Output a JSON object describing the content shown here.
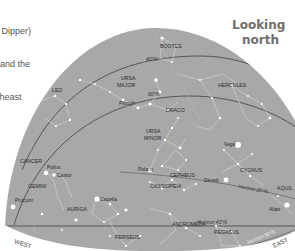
{
  "caption": {
    "lines": [
      "g Dipper)",
      "and the",
      "rtheast"
    ]
  },
  "heading": {
    "line1": "Looking",
    "line2": "north"
  },
  "colors": {
    "sky": "#a8a8a8",
    "sky_edge": "#8f8f8f",
    "line": "#555555",
    "star": "#ffffff",
    "label": "#2a2a2a",
    "heading": "#6e6e6e"
  },
  "zenith": {
    "label": "Zenith",
    "sub": "20°N"
  },
  "directions": {
    "west": "WEST",
    "east": "EAST"
  },
  "latitude_arcs": [
    {
      "label": "40°N"
    },
    {
      "label": "60°N"
    },
    {
      "label": "Horizon 20°N"
    },
    {
      "label": "Horizon 40°N"
    },
    {
      "label": "Horizon 60°N"
    }
  ],
  "constellations": {
    "bootes": "BOOTES",
    "leo": "LEO",
    "ursa_major_1": "URSA",
    "ursa_major_2": "MAJOR",
    "plough": "Plough",
    "hercules": "HERCULES",
    "draco": "DRACO",
    "ursa_minor_1": "URSA",
    "ursa_minor_2": "MINOR",
    "cancer": "CANCER",
    "gemini": "GEMINI",
    "cepheus": "CEPHEUS",
    "cygnus": "CYGNUS",
    "cassiopeia": "CASSIOPEIA",
    "auriga": "AURIGA",
    "andromeda": "ANDROMEDA",
    "perseus": "PERSEUS",
    "pegasus": "PEGASUS",
    "aquila": "AQUIL"
  },
  "stars": {
    "polaris": "Polaris",
    "vega": "Vega",
    "pollux": "Pollux",
    "castor": "Castor",
    "procyon": "Procyon",
    "capella": "Capella",
    "deneb": "Deneb",
    "altair": "Altair"
  }
}
